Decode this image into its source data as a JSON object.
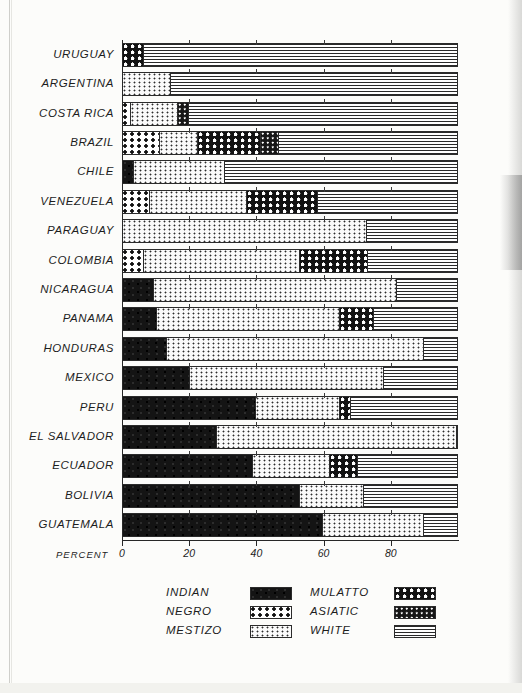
{
  "chart_data": {
    "type": "bar",
    "orientation": "horizontal-stacked",
    "title": "",
    "xlabel": "PERCENT",
    "ylabel": "",
    "xlim": [
      0,
      100
    ],
    "xticks": [
      0,
      20,
      40,
      60,
      80
    ],
    "xtick_labels": [
      "0",
      "20",
      "40",
      "60",
      "80"
    ],
    "grid": false,
    "legend_position": "bottom",
    "categories": [
      "URUGUAY",
      "ARGENTINA",
      "COSTA RICA",
      "BRAZIL",
      "CHILE",
      "VENEZUELA",
      "PARAGUAY",
      "COLOMBIA",
      "NICARAGUA",
      "PANAMA",
      "HONDURAS",
      "MEXICO",
      "PERU",
      "EL SALVADOR",
      "ECUADOR",
      "BOLIVIA",
      "GUATEMALA"
    ],
    "series": [
      {
        "name": "INDIAN",
        "pattern": "indian",
        "values": [
          0,
          0,
          0,
          0,
          3,
          0,
          0,
          0,
          9,
          10,
          13,
          20,
          40,
          28,
          39,
          53,
          60
        ]
      },
      {
        "name": "NEGRO",
        "pattern": "negro",
        "values": [
          0,
          0,
          2,
          11,
          0,
          8,
          0,
          6,
          0,
          0,
          0,
          0,
          0,
          0,
          0,
          0,
          0
        ]
      },
      {
        "name": "MESTIZO",
        "pattern": "mestizo",
        "values": [
          0,
          14,
          14,
          11,
          27,
          29,
          73,
          47,
          73,
          55,
          77,
          58,
          25,
          72,
          23,
          19,
          30
        ]
      },
      {
        "name": "MULATTO",
        "pattern": "mulatto",
        "values": [
          6,
          0,
          0,
          19,
          0,
          21,
          0,
          20,
          0,
          10,
          0,
          0,
          3,
          0,
          8,
          0,
          0
        ]
      },
      {
        "name": "ASIATIC",
        "pattern": "asiatic",
        "values": [
          0,
          0,
          3,
          5,
          0,
          0,
          0,
          0,
          0,
          0,
          0,
          0,
          0,
          0,
          0,
          0,
          0
        ]
      },
      {
        "name": "WHITE",
        "pattern": "white",
        "values": [
          94,
          86,
          81,
          54,
          70,
          42,
          27,
          27,
          18,
          25,
          10,
          22,
          32,
          0,
          30,
          28,
          10
        ]
      }
    ]
  },
  "legend": {
    "entries": [
      {
        "label": "INDIAN",
        "pattern": "indian",
        "column": 1,
        "row": 0
      },
      {
        "label": "NEGRO",
        "pattern": "negro",
        "column": 1,
        "row": 1
      },
      {
        "label": "MESTIZO",
        "pattern": "mestizo",
        "column": 1,
        "row": 2
      },
      {
        "label": "MULATTO",
        "pattern": "mulatto",
        "column": 2,
        "row": 0
      },
      {
        "label": "ASIATIC",
        "pattern": "asiatic",
        "column": 2,
        "row": 1
      },
      {
        "label": "WHITE",
        "pattern": "white",
        "column": 2,
        "row": 2
      }
    ]
  },
  "colors": {
    "ink": "#1d1d1d",
    "paper": "#fcfcfa",
    "rule": "#2b2b2b"
  }
}
